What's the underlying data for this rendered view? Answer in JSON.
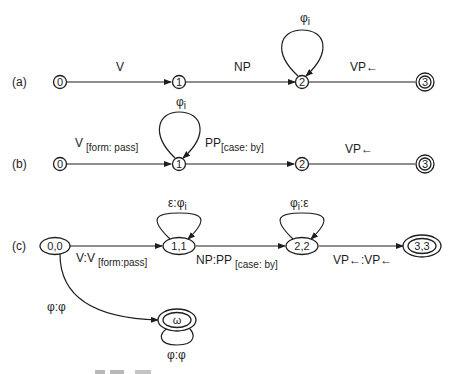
{
  "diagram": {
    "type": "finite-state transducers",
    "panels": [
      {
        "id": "a",
        "label": "(a)",
        "nodes": [
          {
            "id": "0",
            "label": "0",
            "final": false
          },
          {
            "id": "1",
            "label": "1",
            "final": false
          },
          {
            "id": "2",
            "label": "2",
            "final": false
          },
          {
            "id": "3",
            "label": "3",
            "final": true
          }
        ],
        "edges": [
          {
            "from": "0",
            "to": "1",
            "label": "V"
          },
          {
            "from": "1",
            "to": "2",
            "label": "NP"
          },
          {
            "from": "2",
            "to": "2",
            "label": "φi",
            "label_main": "φ",
            "label_sub": "i",
            "loop": true
          },
          {
            "from": "2",
            "to": "3",
            "label": "VP←"
          }
        ]
      },
      {
        "id": "b",
        "label": "(b)",
        "nodes": [
          {
            "id": "0",
            "label": "0",
            "final": false
          },
          {
            "id": "1",
            "label": "1",
            "final": false
          },
          {
            "id": "2",
            "label": "2",
            "final": false
          },
          {
            "id": "3",
            "label": "3",
            "final": true
          }
        ],
        "edges": [
          {
            "from": "0",
            "to": "1",
            "label": "V [form: pass]",
            "label_main": "V",
            "label_sub": "[form: pass]"
          },
          {
            "from": "1",
            "to": "1",
            "label": "φi",
            "label_main": "φ",
            "label_sub": "i",
            "loop": true
          },
          {
            "from": "1",
            "to": "2",
            "label": "PP [case: by]",
            "label_main": "PP",
            "label_sub": "[case: by]"
          },
          {
            "from": "2",
            "to": "3",
            "label": "VP←"
          }
        ]
      },
      {
        "id": "c",
        "label": "(c)",
        "nodes": [
          {
            "id": "0,0",
            "label": "0,0",
            "final": false
          },
          {
            "id": "1,1",
            "label": "1,1",
            "final": false
          },
          {
            "id": "2,2",
            "label": "2,2",
            "final": false
          },
          {
            "id": "3,3",
            "label": "3,3",
            "final": true
          },
          {
            "id": "ω",
            "label": "ω",
            "final": true
          }
        ],
        "edges": [
          {
            "from": "0,0",
            "to": "1,1",
            "label": "V:V [form:pass]",
            "label_main": "V:V",
            "label_sub": "[form:pass]"
          },
          {
            "from": "1,1",
            "to": "1,1",
            "label": "ε:φi",
            "label_main": "ε:φ",
            "label_sub": "i",
            "loop": true
          },
          {
            "from": "1,1",
            "to": "2,2",
            "label": "NP:PP [case: by]",
            "label_main": "NP:PP",
            "label_sub": "[case: by]"
          },
          {
            "from": "2,2",
            "to": "2,2",
            "label": "φi:ε",
            "label_main": "φ",
            "label_sub": "i",
            "label_tail": ":ε",
            "loop": true
          },
          {
            "from": "2,2",
            "to": "3,3",
            "label": "VP←:VP←"
          },
          {
            "from": "0,0",
            "to": "ω",
            "label": "φ:φ"
          },
          {
            "from": "ω",
            "to": "ω",
            "label": "φ:φ",
            "loop": true
          }
        ]
      }
    ],
    "caption": "Fig. 11.x (cut off)"
  }
}
